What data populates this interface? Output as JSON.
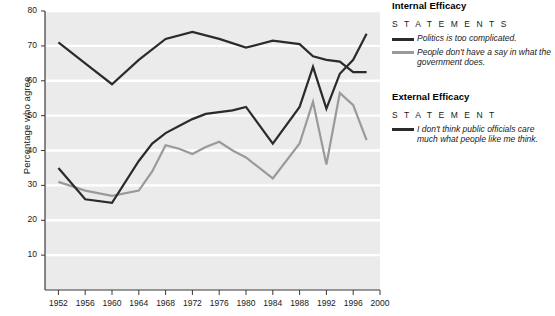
{
  "chart_data": {
    "type": "line",
    "title": "",
    "xlabel": "",
    "ylabel": "Percentage who agree",
    "xlim": [
      1950,
      2000
    ],
    "ylim": [
      0,
      80
    ],
    "yticks": [
      10,
      20,
      30,
      40,
      50,
      60,
      70,
      80
    ],
    "xticks": [
      1952,
      1956,
      1960,
      1964,
      1968,
      1972,
      1976,
      1980,
      1984,
      1988,
      1992,
      1996,
      2000
    ],
    "grid": "horizontal-white-on-gray",
    "legend_position": "right",
    "series": [
      {
        "name": "Politics is too complicated.",
        "group": "Internal Efficacy",
        "color": "#2b2b2b",
        "x": [
          1952,
          1956,
          1960,
          1964,
          1968,
          1972,
          1976,
          1980,
          1984,
          1988,
          1990,
          1992,
          1994,
          1996,
          1998
        ],
        "values": [
          71,
          65,
          59,
          66,
          72,
          74,
          72,
          69.5,
          71.5,
          70.5,
          67,
          66,
          65.5,
          62.5,
          62.5
        ]
      },
      {
        "name": "People don't have a say in what the government does.",
        "group": "Internal Efficacy",
        "color": "#9a9a9a",
        "x": [
          1952,
          1956,
          1960,
          1964,
          1966,
          1968,
          1970,
          1972,
          1974,
          1976,
          1978,
          1980,
          1984,
          1988,
          1990,
          1992,
          1994,
          1996,
          1998
        ],
        "values": [
          31,
          28.5,
          27,
          28.5,
          34,
          41.5,
          40.5,
          39,
          41,
          42.5,
          40,
          38,
          32,
          42,
          54,
          36,
          56.5,
          53,
          43
        ]
      },
      {
        "name": "I don't think public officials care much what people like me think.",
        "group": "External Efficacy",
        "color": "#2b2b2b",
        "x": [
          1952,
          1956,
          1960,
          1964,
          1966,
          1968,
          1970,
          1972,
          1974,
          1976,
          1978,
          1980,
          1984,
          1988,
          1990,
          1992,
          1994,
          1996,
          1998
        ],
        "values": [
          35,
          26,
          25,
          37,
          42,
          45,
          47,
          49,
          50.5,
          51,
          51.5,
          52.5,
          42,
          52.5,
          64,
          52,
          62,
          66,
          73.5
        ]
      }
    ]
  },
  "axis": {
    "ylabel": "Percentage who agree",
    "yticks": [
      "80",
      "70",
      "60",
      "50",
      "40",
      "30",
      "20",
      "10"
    ],
    "xticks": [
      "1952",
      "1956",
      "1960",
      "1964",
      "1968",
      "1972",
      "1976",
      "1980",
      "1984",
      "1988",
      "1992",
      "1996",
      "2000"
    ]
  },
  "legend": {
    "groups": [
      {
        "heading": "Internal Efficacy",
        "subheading": "S T A T E M E N T S",
        "entries": [
          {
            "label": "Politics is too complicated.",
            "color": "#2b2b2b"
          },
          {
            "label": "People don't have a say in what the government does.",
            "color": "#9a9a9a"
          }
        ]
      },
      {
        "heading": "External Efficacy",
        "subheading": "S T A T E M E N T",
        "entries": [
          {
            "label": "I don't think public officials care much what people like me think.",
            "color": "#2b2b2b"
          }
        ]
      }
    ]
  },
  "colors": {
    "plot_background": "#ebebeb",
    "gridline": "#ffffff",
    "axis": "#3a3a3a",
    "dark_series": "#2b2b2b",
    "gray_series": "#9a9a9a"
  }
}
